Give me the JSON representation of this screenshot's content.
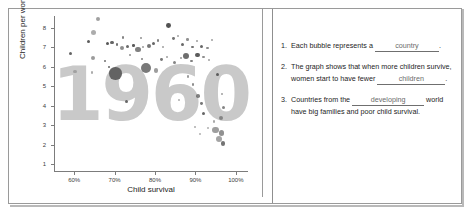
{
  "worksheet": {
    "title": "Child survival vs children per woman worksheet"
  },
  "chart_panel": {
    "watermark": "1960"
  },
  "chart_data": {
    "type": "scatter",
    "title": "1960",
    "xlabel": "Child survival",
    "ylabel": "Children per woman",
    "xlim": [
      55,
      103
    ],
    "ylim": [
      0.6,
      8.6
    ],
    "xticks": [
      "60%",
      "70%",
      "80%",
      "90%",
      "100%"
    ],
    "xtick_values": [
      60,
      70,
      80,
      90,
      100
    ],
    "yticks": [
      "1",
      "2",
      "3",
      "4",
      "5",
      "6",
      "7",
      "8"
    ],
    "ytick_values": [
      1,
      2,
      3,
      4,
      5,
      6,
      7,
      8
    ],
    "grid": false,
    "legend": "none",
    "annotation": "Each bubble is a country; bubble area is population.",
    "points": [
      {
        "x": 65.8,
        "y": 8.45,
        "r": 2.0,
        "c": "#8f8f8f"
      },
      {
        "x": 64.8,
        "y": 7.75,
        "r": 2.6,
        "c": "#9e9e9e"
      },
      {
        "x": 63.5,
        "y": 7.3,
        "r": 1.6,
        "c": "#3f3f3f"
      },
      {
        "x": 72.0,
        "y": 7.5,
        "r": 1.2,
        "c": "#6f6f6f"
      },
      {
        "x": 76.5,
        "y": 7.45,
        "r": 1.0,
        "c": "#7c7c7c"
      },
      {
        "x": 68.2,
        "y": 7.2,
        "r": 1.5,
        "c": "#3a3a3a"
      },
      {
        "x": 69.4,
        "y": 7.25,
        "r": 1.8,
        "c": "#4a4a4a"
      },
      {
        "x": 70.6,
        "y": 7.15,
        "r": 1.4,
        "c": "#5a5a5a"
      },
      {
        "x": 71.8,
        "y": 6.95,
        "r": 2.2,
        "c": "#7a7a7a"
      },
      {
        "x": 73.2,
        "y": 7.05,
        "r": 1.6,
        "c": "#4f4f4f"
      },
      {
        "x": 74.6,
        "y": 7.1,
        "r": 1.3,
        "c": "#3d3d3d"
      },
      {
        "x": 75.8,
        "y": 6.9,
        "r": 2.6,
        "c": "#6a6a6a"
      },
      {
        "x": 77.0,
        "y": 7.0,
        "r": 1.1,
        "c": "#8a8a8a"
      },
      {
        "x": 78.4,
        "y": 7.05,
        "r": 2.0,
        "c": "#5e5e5e"
      },
      {
        "x": 79.6,
        "y": 7.2,
        "r": 1.5,
        "c": "#4a4a4a"
      },
      {
        "x": 80.8,
        "y": 7.35,
        "r": 1.2,
        "c": "#6d6d6d"
      },
      {
        "x": 82.0,
        "y": 7.0,
        "r": 1.0,
        "c": "#8d8d8d"
      },
      {
        "x": 83.4,
        "y": 8.1,
        "r": 2.4,
        "c": "#343434"
      },
      {
        "x": 84.6,
        "y": 7.45,
        "r": 1.4,
        "c": "#5c5c5c"
      },
      {
        "x": 85.8,
        "y": 7.6,
        "r": 1.0,
        "c": "#909090"
      },
      {
        "x": 86.8,
        "y": 7.15,
        "r": 1.6,
        "c": "#4e4e4e"
      },
      {
        "x": 88.0,
        "y": 7.4,
        "r": 1.2,
        "c": "#7e7e7e"
      },
      {
        "x": 89.2,
        "y": 7.0,
        "r": 1.3,
        "c": "#5a5a5a"
      },
      {
        "x": 90.4,
        "y": 7.3,
        "r": 1.0,
        "c": "#8b8b8b"
      },
      {
        "x": 91.6,
        "y": 7.05,
        "r": 1.5,
        "c": "#4c4c4c"
      },
      {
        "x": 93.0,
        "y": 6.95,
        "r": 1.1,
        "c": "#777777"
      },
      {
        "x": 94.2,
        "y": 7.35,
        "r": 1.0,
        "c": "#8e8e8e"
      },
      {
        "x": 59.2,
        "y": 6.7,
        "r": 1.5,
        "c": "#4a4a4a"
      },
      {
        "x": 64.6,
        "y": 6.45,
        "r": 2.3,
        "c": "#8a8a8a"
      },
      {
        "x": 60.2,
        "y": 5.75,
        "r": 1.7,
        "c": "#9a9a9a"
      },
      {
        "x": 64.4,
        "y": 5.7,
        "r": 1.4,
        "c": "#9e9e9e"
      },
      {
        "x": 67.6,
        "y": 6.3,
        "r": 1.0,
        "c": "#555555"
      },
      {
        "x": 68.6,
        "y": 6.0,
        "r": 1.2,
        "c": "#4a4a4a"
      },
      {
        "x": 70.2,
        "y": 5.65,
        "r": 6.2,
        "c": "#5a5a5a"
      },
      {
        "x": 73.8,
        "y": 6.6,
        "r": 1.0,
        "c": "#7a7a7a"
      },
      {
        "x": 76.8,
        "y": 6.4,
        "r": 1.3,
        "c": "#6a6a6a"
      },
      {
        "x": 77.8,
        "y": 5.95,
        "r": 5.0,
        "c": "#6e6e6e"
      },
      {
        "x": 80.2,
        "y": 5.8,
        "r": 2.2,
        "c": "#8c8c8c"
      },
      {
        "x": 81.6,
        "y": 6.35,
        "r": 1.4,
        "c": "#606060"
      },
      {
        "x": 83.0,
        "y": 6.5,
        "r": 1.0,
        "c": "#8d8d8d"
      },
      {
        "x": 84.8,
        "y": 6.2,
        "r": 1.6,
        "c": "#707070"
      },
      {
        "x": 86.4,
        "y": 6.45,
        "r": 1.1,
        "c": "#858585"
      },
      {
        "x": 87.6,
        "y": 6.55,
        "r": 3.0,
        "c": "#555555"
      },
      {
        "x": 89.0,
        "y": 6.3,
        "r": 1.3,
        "c": "#6c6c6c"
      },
      {
        "x": 90.6,
        "y": 6.6,
        "r": 2.4,
        "c": "#3f3f3f"
      },
      {
        "x": 92.0,
        "y": 6.5,
        "r": 1.2,
        "c": "#7b7b7b"
      },
      {
        "x": 93.4,
        "y": 6.35,
        "r": 1.0,
        "c": "#8f8f8f"
      },
      {
        "x": 73.0,
        "y": 4.2,
        "r": 1.5,
        "c": "#4c4c4c"
      },
      {
        "x": 88.2,
        "y": 5.5,
        "r": 1.2,
        "c": "#8a8a8a"
      },
      {
        "x": 89.4,
        "y": 5.1,
        "r": 1.3,
        "c": "#7a7a7a"
      },
      {
        "x": 86.0,
        "y": 4.3,
        "r": 1.0,
        "c": "#9b9b9b"
      },
      {
        "x": 90.6,
        "y": 4.5,
        "r": 1.8,
        "c": "#6b6b6b"
      },
      {
        "x": 91.4,
        "y": 4.1,
        "r": 1.4,
        "c": "#5f5f5f"
      },
      {
        "x": 92.0,
        "y": 3.6,
        "r": 1.9,
        "c": "#4a4a4a"
      },
      {
        "x": 95.4,
        "y": 5.6,
        "r": 1.6,
        "c": "#484848"
      },
      {
        "x": 96.6,
        "y": 4.6,
        "r": 1.2,
        "c": "#8e8e8e"
      },
      {
        "x": 97.0,
        "y": 3.9,
        "r": 1.5,
        "c": "#6f6f6f"
      },
      {
        "x": 96.2,
        "y": 3.35,
        "r": 2.0,
        "c": "#787878"
      },
      {
        "x": 94.6,
        "y": 3.2,
        "r": 1.3,
        "c": "#9a9a9a"
      },
      {
        "x": 93.2,
        "y": 2.85,
        "r": 1.1,
        "c": "#a0a0a0"
      },
      {
        "x": 95.0,
        "y": 2.75,
        "r": 3.2,
        "c": "#8d8d8d"
      },
      {
        "x": 96.4,
        "y": 2.6,
        "r": 2.6,
        "c": "#7e7e7e"
      },
      {
        "x": 95.8,
        "y": 2.3,
        "r": 3.0,
        "c": "#949494"
      },
      {
        "x": 96.8,
        "y": 2.05,
        "r": 2.4,
        "c": "#5c5c5c"
      },
      {
        "x": 91.2,
        "y": 2.55,
        "r": 1.0,
        "c": "#a2a2a2"
      },
      {
        "x": 89.8,
        "y": 2.9,
        "r": 1.0,
        "c": "#9c9c9c"
      }
    ]
  },
  "questions": [
    {
      "number": "1.",
      "text_before": "Each bubble represents a ",
      "answer": "country",
      "text_after": "."
    },
    {
      "number": "2.",
      "text_before": "The graph shows that when more children survive, women start to have fewer ",
      "answer": "children",
      "text_after": "."
    },
    {
      "number": "3.",
      "text_before": "Countries from the ",
      "answer": "developing",
      "text_after": " world have big families and poor child survival."
    }
  ]
}
